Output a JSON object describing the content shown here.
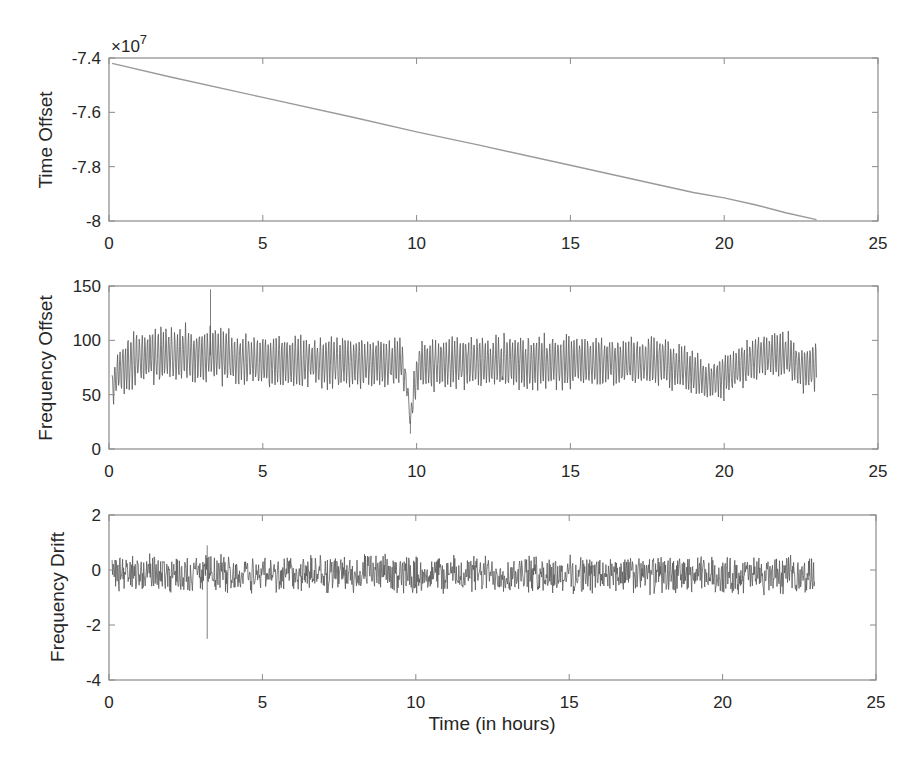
{
  "chart_data": [
    {
      "type": "line",
      "title": "",
      "xlabel": "",
      "ylabel": "Time Offset",
      "exponent_label": "×10",
      "exponent_power": "7",
      "xlim": [
        0,
        25
      ],
      "ylim": [
        -8,
        -7.4
      ],
      "xticks": [
        0,
        5,
        10,
        15,
        20,
        25
      ],
      "yticks": [
        -8,
        -7.8,
        -7.6,
        -7.4
      ],
      "ytick_labels": [
        "-8",
        "-7.8",
        "-7.6",
        "-7.4"
      ],
      "grid": false,
      "series": [
        {
          "name": "Time Offset",
          "color": "#9a9a9a",
          "x": [
            0.1,
            2,
            5,
            8,
            10,
            12,
            15,
            18,
            19,
            20,
            21,
            22,
            23
          ],
          "y": [
            -7.42,
            -7.47,
            -7.545,
            -7.62,
            -7.672,
            -7.72,
            -7.795,
            -7.87,
            -7.895,
            -7.915,
            -7.94,
            -7.97,
            -7.995
          ]
        }
      ]
    },
    {
      "type": "line",
      "title": "",
      "xlabel": "",
      "ylabel": "Frequency Offset",
      "xlim": [
        0,
        25
      ],
      "ylim": [
        0,
        150
      ],
      "xticks": [
        0,
        5,
        10,
        15,
        20,
        25
      ],
      "yticks": [
        0,
        50,
        100,
        150
      ],
      "ytick_labels": [
        "0",
        "50",
        "100",
        "150"
      ],
      "grid": false,
      "series": [
        {
          "name": "Frequency Offset",
          "color": "#555555",
          "x_end": 23,
          "envelope_x": [
            0.1,
            0.3,
            0.8,
            2,
            3.5,
            5,
            7,
            9.5,
            9.7,
            9.8,
            9.9,
            10.1,
            12,
            15,
            18,
            18.8,
            19.5,
            20.2,
            21,
            22,
            22.6,
            23
          ],
          "envelope_center": [
            55,
            72,
            82,
            87,
            86,
            80,
            80,
            80,
            55,
            25,
            55,
            78,
            80,
            80,
            80,
            72,
            62,
            70,
            85,
            87,
            72,
            75
          ],
          "envelope_amplitude": [
            15,
            20,
            22,
            22,
            22,
            20,
            20,
            20,
            10,
            5,
            15,
            20,
            20,
            20,
            20,
            18,
            15,
            18,
            18,
            18,
            20,
            20
          ],
          "notable_points": [
            {
              "x": 3.3,
              "y": 147,
              "note": "spike"
            },
            {
              "x": 9.8,
              "y": 14,
              "note": "dip"
            }
          ]
        }
      ]
    },
    {
      "type": "line",
      "title": "",
      "xlabel": "Time (in hours)",
      "ylabel": "Frequency Drift",
      "xlim": [
        0,
        25
      ],
      "ylim": [
        -4,
        2
      ],
      "xticks": [
        0,
        5,
        10,
        15,
        20,
        25
      ],
      "yticks": [
        -4,
        -2,
        0,
        2
      ],
      "ytick_labels": [
        "-4",
        "-2",
        "0",
        "2"
      ],
      "grid": false,
      "series": [
        {
          "name": "Frequency Drift",
          "color": "#555555",
          "x_end": 23,
          "envelope_x": [
            0.1,
            23
          ],
          "envelope_center": [
            -0.1,
            -0.2
          ],
          "envelope_amplitude": [
            0.7,
            0.7
          ],
          "notable_points": [
            {
              "x": 3.2,
              "y": -2.5,
              "note": "negative spike"
            },
            {
              "x": 3.2,
              "y": 0.9,
              "note": "positive spike"
            }
          ]
        }
      ]
    }
  ],
  "figure": {
    "xtick_labels": [
      "0",
      "5",
      "10",
      "15",
      "20",
      "25"
    ],
    "shared_xlabel": "Time (in hours)"
  }
}
